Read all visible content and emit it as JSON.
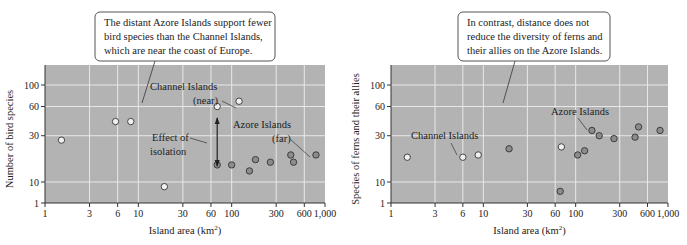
{
  "chart_data": [
    {
      "type": "scatter",
      "title": "",
      "xlabel": "Island area (km²)",
      "ylabel": "Number of bird species",
      "x_scale": "log",
      "xlim": [
        1,
        1000
      ],
      "ylim": [
        1,
        150
      ],
      "grid": true,
      "x_ticks": [
        "1",
        "3",
        "6",
        "10",
        "30",
        "60",
        "100",
        "300",
        "600",
        "1,000"
      ],
      "y_ticks": [
        "1",
        "10",
        "30",
        "60",
        "100"
      ],
      "callout": "The distant Azore Islands support fewer bird species than the Channel Islands, which are near the coast of Europe.",
      "callout_lines": [
        "The distant Azore Islands support fewer",
        "bird species than the Channel Islands,",
        "which are near the coast of Europe."
      ],
      "annotations": [
        {
          "text": "Channel Islands",
          "text2": "(near)"
        },
        {
          "text": "Azore Islands",
          "text2": "(far)"
        },
        {
          "text": "Effect of",
          "text2": "isolation"
        }
      ],
      "series": [
        {
          "name": "Channel Islands (near)",
          "marker": "open-circle",
          "points": [
            [
              1.5,
              27
            ],
            [
              5.7,
              42
            ],
            [
              8.3,
              42
            ],
            [
              19,
              8
            ],
            [
              70,
              60
            ],
            [
              120,
              68
            ]
          ]
        },
        {
          "name": "Azore Islands (far)",
          "marker": "filled-circle",
          "points": [
            [
              70,
              15
            ],
            [
              100,
              15
            ],
            [
              155,
              13
            ],
            [
              180,
              17
            ],
            [
              260,
              16
            ],
            [
              430,
              19
            ],
            [
              460,
              16
            ],
            [
              800,
              19
            ]
          ]
        }
      ]
    },
    {
      "type": "scatter",
      "title": "",
      "xlabel": "Island area (km²)",
      "ylabel": "Species of ferns and their allies",
      "x_scale": "log",
      "xlim": [
        1,
        1000
      ],
      "ylim": [
        1,
        150
      ],
      "grid": true,
      "x_ticks": [
        "1",
        "3",
        "6",
        "10",
        "30",
        "60",
        "100",
        "300",
        "600",
        "1,000"
      ],
      "y_ticks": [
        "1",
        "10",
        "30",
        "60",
        "100"
      ],
      "callout": "In contrast, distance does not reduce the diversity of ferns and their allies on the Azore Islands.",
      "callout_lines": [
        "In contrast, distance does not",
        "reduce the diversity of ferns and",
        "their allies on the Azore Islands."
      ],
      "annotations": [
        {
          "text": "Channel Islands"
        },
        {
          "text": "Azore Islands"
        }
      ],
      "series": [
        {
          "name": "Channel Islands",
          "marker": "open-circle",
          "points": [
            [
              1.5,
              18
            ],
            [
              6,
              18
            ],
            [
              8.8,
              19
            ],
            [
              70,
              23
            ]
          ]
        },
        {
          "name": "Azore Islands",
          "marker": "filled-circle",
          "points": [
            [
              19,
              22
            ],
            [
              68,
              6
            ],
            [
              105,
              19
            ],
            [
              125,
              21
            ],
            [
              150,
              34
            ],
            [
              180,
              30
            ],
            [
              260,
              28
            ],
            [
              440,
              29
            ],
            [
              480,
              37
            ],
            [
              820,
              34
            ]
          ]
        }
      ]
    }
  ],
  "colors": {
    "plot_bg": "#b3b3b3",
    "grid": "#e8e8e8",
    "open_marker_fill": "#f0f0f0",
    "filled_marker_fill": "#8c8c8c",
    "marker_stroke": "#333333",
    "text": "#222222"
  }
}
